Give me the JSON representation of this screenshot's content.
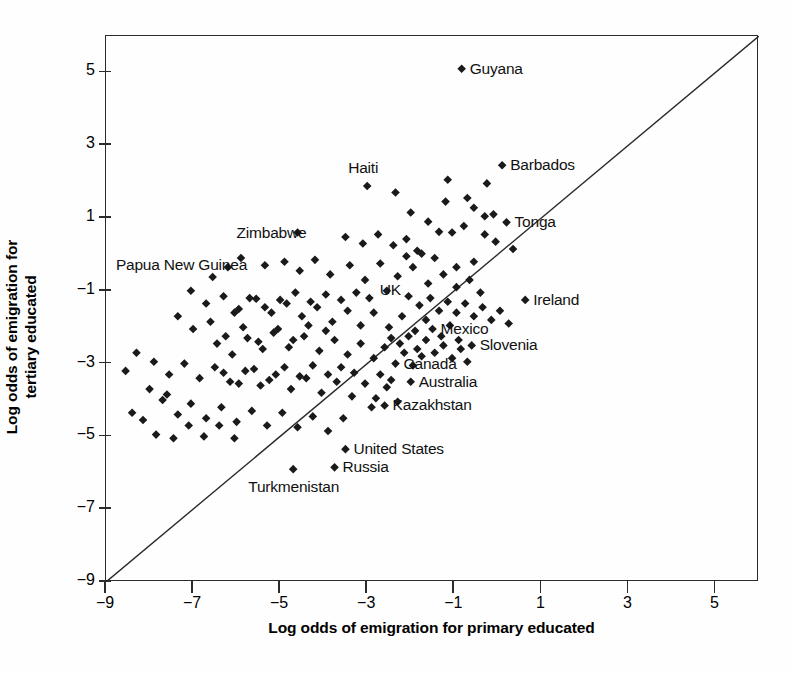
{
  "chart_data": {
    "type": "scatter",
    "title": "",
    "xlabel": "Log odds of emigration for primary educated",
    "ylabel": "Log odds of emigration for tertiary educated",
    "xlim": [
      -9,
      6
    ],
    "ylim": [
      -9,
      6
    ],
    "xticks": [
      -9,
      -7,
      -5,
      -3,
      -1,
      1,
      3,
      5
    ],
    "yticks": [
      -9,
      -7,
      -5,
      -3,
      -1,
      1,
      3,
      5
    ],
    "xtick_labels": [
      "−9",
      "−7",
      "−5",
      "−3",
      "−1",
      "1",
      "3",
      "5"
    ],
    "ytick_labels": [
      "−9",
      "−7",
      "−5",
      "−3",
      "−1",
      "1",
      "3",
      "5"
    ],
    "grid": false,
    "legend": "none",
    "marker": "diamond",
    "marker_color": "#1a1a1a",
    "reference_line": {
      "type": "identity",
      "label": "y = x",
      "from": [
        -9,
        -9
      ],
      "to": [
        6,
        6
      ]
    },
    "annotations": [
      {
        "label": "Guyana",
        "x": -0.83,
        "y": 5.1,
        "dx": 9,
        "dy": -8
      },
      {
        "label": "Barbados",
        "x": 0.1,
        "y": 2.45,
        "dx": 9,
        "dy": -8
      },
      {
        "label": "Tonga",
        "x": 0.2,
        "y": 0.88,
        "dx": 9,
        "dy": -8
      },
      {
        "label": "Haiti",
        "x": -3.0,
        "y": 1.88,
        "dx": -18,
        "dy": -26
      },
      {
        "label": "Zimbabwe",
        "x": -4.6,
        "y": 0.6,
        "dx": -60,
        "dy": -8
      },
      {
        "label": "Papua New Guinea",
        "x": -5.35,
        "y": -0.3,
        "dx": -148,
        "dy": -8
      },
      {
        "label": "UK",
        "x": -2.55,
        "y": -1.0,
        "dx": -6,
        "dy": -9
      },
      {
        "label": "Ireland",
        "x": 0.63,
        "y": -1.25,
        "dx": 9,
        "dy": -8
      },
      {
        "label": "Mexico",
        "x": -1.5,
        "y": -2.05,
        "dx": 9,
        "dy": -8
      },
      {
        "label": "Slovenia",
        "x": -0.6,
        "y": -2.5,
        "dx": 9,
        "dy": -8
      },
      {
        "label": "Canada",
        "x": -2.35,
        "y": -3.0,
        "dx": 9,
        "dy": -8
      },
      {
        "label": "Australia",
        "x": -2.0,
        "y": -3.5,
        "dx": 9,
        "dy": -8
      },
      {
        "label": "Kazakhstan",
        "x": -2.6,
        "y": -4.15,
        "dx": 9,
        "dy": -8
      },
      {
        "label": "United States",
        "x": -3.5,
        "y": -5.35,
        "dx": 9,
        "dy": -8
      },
      {
        "label": "Russia",
        "x": -3.75,
        "y": -5.85,
        "dx": 9,
        "dy": -8
      },
      {
        "label": "Turkmenistan",
        "x": -4.7,
        "y": -5.9,
        "dx": -44,
        "dy": 10
      }
    ],
    "points": [
      [
        -0.83,
        5.1
      ],
      [
        0.1,
        2.45
      ],
      [
        -1.15,
        2.05
      ],
      [
        -0.25,
        1.95
      ],
      [
        -3.0,
        1.88
      ],
      [
        -2.35,
        1.7
      ],
      [
        0.2,
        0.88
      ],
      [
        -0.55,
        1.28
      ],
      [
        -0.3,
        1.05
      ],
      [
        -0.1,
        1.1
      ],
      [
        -0.78,
        0.78
      ],
      [
        -1.05,
        0.6
      ],
      [
        -1.35,
        0.62
      ],
      [
        -4.6,
        0.6
      ],
      [
        -3.5,
        0.48
      ],
      [
        -2.75,
        0.55
      ],
      [
        -3.1,
        0.3
      ],
      [
        -2.4,
        0.25
      ],
      [
        -2.1,
        0.42
      ],
      [
        -1.85,
        0.1
      ],
      [
        -5.35,
        -0.3
      ],
      [
        -5.9,
        -0.1
      ],
      [
        -6.2,
        -0.35
      ],
      [
        -6.55,
        -0.62
      ],
      [
        -4.9,
        -0.2
      ],
      [
        -4.55,
        -0.45
      ],
      [
        -4.2,
        -0.15
      ],
      [
        -3.85,
        -0.55
      ],
      [
        -3.4,
        -0.3
      ],
      [
        -3.05,
        -0.7
      ],
      [
        -2.7,
        -0.25
      ],
      [
        -2.3,
        -0.6
      ],
      [
        -1.95,
        -0.35
      ],
      [
        -1.6,
        -0.8
      ],
      [
        -1.25,
        -0.55
      ],
      [
        -0.95,
        -0.9
      ],
      [
        -0.65,
        -0.7
      ],
      [
        -0.4,
        -1.05
      ],
      [
        0.63,
        -1.25
      ],
      [
        -7.05,
        -1.0
      ],
      [
        -6.7,
        -1.35
      ],
      [
        -6.3,
        -1.15
      ],
      [
        -5.95,
        -1.5
      ],
      [
        -5.55,
        -1.22
      ],
      [
        -5.2,
        -1.6
      ],
      [
        -4.85,
        -1.35
      ],
      [
        -4.5,
        -1.7
      ],
      [
        -4.15,
        -1.45
      ],
      [
        -3.8,
        -1.85
      ],
      [
        -3.45,
        -1.55
      ],
      [
        -3.15,
        -1.95
      ],
      [
        -2.85,
        -1.6
      ],
      [
        -2.55,
        -1.0
      ],
      [
        -2.5,
        -2.0
      ],
      [
        -2.2,
        -1.7
      ],
      [
        -1.9,
        -2.1
      ],
      [
        -1.65,
        -1.8
      ],
      [
        -1.5,
        -2.05
      ],
      [
        -1.3,
        -2.25
      ],
      [
        -1.1,
        -1.95
      ],
      [
        -0.9,
        -2.35
      ],
      [
        -0.6,
        -2.5
      ],
      [
        -7.35,
        -1.7
      ],
      [
        -7.0,
        -2.05
      ],
      [
        -6.6,
        -1.85
      ],
      [
        -6.25,
        -2.25
      ],
      [
        -5.85,
        -2.0
      ],
      [
        -5.5,
        -2.4
      ],
      [
        -5.15,
        -2.15
      ],
      [
        -4.8,
        -2.55
      ],
      [
        -4.45,
        -2.25
      ],
      [
        -4.1,
        -2.65
      ],
      [
        -3.75,
        -2.35
      ],
      [
        -3.45,
        -2.75
      ],
      [
        -3.15,
        -2.45
      ],
      [
        -2.85,
        -2.85
      ],
      [
        -2.6,
        -2.55
      ],
      [
        -2.35,
        -3.0
      ],
      [
        -2.15,
        -2.7
      ],
      [
        -1.95,
        -3.05
      ],
      [
        -1.75,
        -2.8
      ],
      [
        -2.0,
        -3.5
      ],
      [
        -8.3,
        -2.7
      ],
      [
        -8.55,
        -3.2
      ],
      [
        -7.9,
        -2.95
      ],
      [
        -7.55,
        -3.3
      ],
      [
        -7.2,
        -3.0
      ],
      [
        -6.85,
        -3.4
      ],
      [
        -6.5,
        -3.1
      ],
      [
        -6.15,
        -3.5
      ],
      [
        -5.8,
        -3.2
      ],
      [
        -5.45,
        -3.6
      ],
      [
        -5.1,
        -3.3
      ],
      [
        -4.75,
        -3.7
      ],
      [
        -4.4,
        -3.4
      ],
      [
        -4.05,
        -3.8
      ],
      [
        -3.7,
        -3.5
      ],
      [
        -3.35,
        -3.9
      ],
      [
        -3.05,
        -3.55
      ],
      [
        -2.8,
        -3.95
      ],
      [
        -2.55,
        -3.65
      ],
      [
        -2.3,
        -4.05
      ],
      [
        -2.6,
        -4.15
      ],
      [
        -2.9,
        -4.2
      ],
      [
        -7.7,
        -4.0
      ],
      [
        -7.35,
        -4.4
      ],
      [
        -7.05,
        -4.1
      ],
      [
        -6.7,
        -4.5
      ],
      [
        -6.35,
        -4.2
      ],
      [
        -6.0,
        -4.6
      ],
      [
        -5.65,
        -4.3
      ],
      [
        -5.3,
        -4.7
      ],
      [
        -4.95,
        -4.35
      ],
      [
        -4.6,
        -4.75
      ],
      [
        -4.25,
        -4.45
      ],
      [
        -3.9,
        -4.85
      ],
      [
        -3.55,
        -4.5
      ],
      [
        -8.15,
        -4.55
      ],
      [
        -7.85,
        -4.95
      ],
      [
        -7.45,
        -5.05
      ],
      [
        -7.1,
        -4.7
      ],
      [
        -6.75,
        -5.0
      ],
      [
        -6.4,
        -4.7
      ],
      [
        -6.05,
        -5.05
      ],
      [
        -3.5,
        -5.35
      ],
      [
        -3.75,
        -5.85
      ],
      [
        -4.7,
        -5.9
      ],
      [
        -2.05,
        -1.15
      ],
      [
        -1.8,
        -1.4
      ],
      [
        -1.55,
        -1.2
      ],
      [
        -1.35,
        -1.55
      ],
      [
        -1.15,
        -1.3
      ],
      [
        -0.95,
        -1.6
      ],
      [
        -0.75,
        -1.35
      ],
      [
        -0.55,
        -1.7
      ],
      [
        -0.35,
        -1.45
      ],
      [
        -0.15,
        -1.8
      ],
      [
        0.05,
        -1.55
      ],
      [
        0.25,
        -1.9
      ],
      [
        -2.95,
        -1.2
      ],
      [
        -3.25,
        -1.05
      ],
      [
        -3.6,
        -1.25
      ],
      [
        -3.95,
        -1.1
      ],
      [
        -4.3,
        -1.3
      ],
      [
        -4.65,
        -1.05
      ],
      [
        -5.0,
        -1.25
      ],
      [
        -5.35,
        -1.45
      ],
      [
        -5.7,
        -1.2
      ],
      [
        -6.05,
        -1.6
      ],
      [
        -2.45,
        -2.3
      ],
      [
        -2.25,
        -2.45
      ],
      [
        -2.05,
        -2.25
      ],
      [
        -1.85,
        -2.6
      ],
      [
        -1.65,
        -2.35
      ],
      [
        -1.45,
        -2.7
      ],
      [
        -1.25,
        -2.5
      ],
      [
        -1.05,
        -2.85
      ],
      [
        -0.85,
        -2.6
      ],
      [
        -0.7,
        -2.95
      ],
      [
        -3.95,
        -2.1
      ],
      [
        -4.35,
        -1.95
      ],
      [
        -4.7,
        -2.35
      ],
      [
        -5.05,
        -2.05
      ],
      [
        -5.4,
        -2.6
      ],
      [
        -5.75,
        -2.3
      ],
      [
        -6.1,
        -2.75
      ],
      [
        -6.45,
        -2.45
      ],
      [
        -3.3,
        -3.25
      ],
      [
        -3.6,
        -3.1
      ],
      [
        -3.9,
        -3.3
      ],
      [
        -4.25,
        -3.05
      ],
      [
        -4.55,
        -3.35
      ],
      [
        -4.9,
        -3.1
      ],
      [
        -5.25,
        -3.45
      ],
      [
        -5.6,
        -3.15
      ],
      [
        -5.95,
        -3.55
      ],
      [
        -6.3,
        -3.25
      ],
      [
        -2.7,
        -3.3
      ],
      [
        -2.45,
        -3.45
      ],
      [
        -0.95,
        -0.35
      ],
      [
        -0.55,
        -0.2
      ],
      [
        -1.45,
        -0.1
      ],
      [
        -1.75,
        0.02
      ],
      [
        -2.1,
        -0.05
      ],
      [
        -0.3,
        0.55
      ],
      [
        -0.05,
        0.35
      ],
      [
        0.35,
        0.15
      ],
      [
        -1.2,
        1.45
      ],
      [
        -0.7,
        1.55
      ],
      [
        -1.6,
        0.9
      ],
      [
        -2.0,
        1.15
      ],
      [
        -8.0,
        -3.7
      ],
      [
        -7.6,
        -3.85
      ],
      [
        -8.4,
        -4.35
      ]
    ]
  }
}
